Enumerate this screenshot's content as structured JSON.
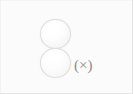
{
  "figure": {
    "background_color": "#fbfbfb",
    "width": 133,
    "height": 94,
    "annotation": {
      "text": "(×)",
      "color": "#8c8c8c"
    },
    "objects": [
      {
        "name": "sphere-top",
        "shape": "circle",
        "fill_color": "#fdfdfd",
        "stroke_color": "#dedede"
      },
      {
        "name": "sphere-bottom",
        "shape": "circle",
        "fill_color": "#fdfdfd",
        "stroke_color": "#dedede"
      }
    ]
  },
  "chart_data": {
    "type": "scatter",
    "title": "",
    "xlabel": "",
    "ylabel": "",
    "annotations": [
      "(×)"
    ],
    "series": [
      {
        "name": "spheres",
        "marker": "circle",
        "points": [
          {
            "x": 56,
            "y": 34,
            "r": 15.5,
            "label": ""
          },
          {
            "x": 56,
            "y": 63,
            "r": 15.5,
            "label": ""
          }
        ]
      }
    ],
    "grid": false,
    "legend": null
  }
}
